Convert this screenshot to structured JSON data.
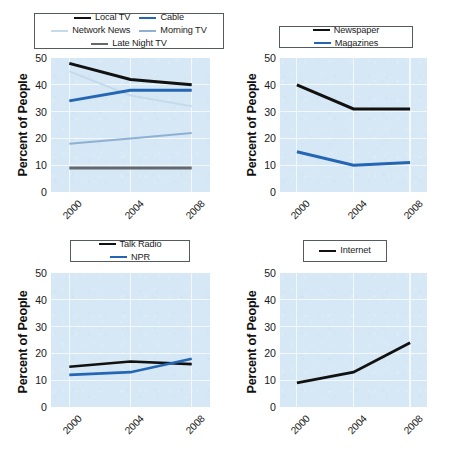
{
  "figure": {
    "background_color": "#ffffff",
    "panel_background_color": "#d6e8f5",
    "gridline_color": "#f2f8fc",
    "ylabel": "Percent of People",
    "yticks": [
      "0",
      "10",
      "20",
      "30",
      "40",
      "50"
    ],
    "xticks": [
      "2000",
      "2004",
      "2008"
    ]
  },
  "chart_data": [
    {
      "type": "line",
      "panel": "top-left",
      "title": "",
      "xlabel": "",
      "ylabel": "Percent of People",
      "x": [
        2000,
        2004,
        2008
      ],
      "xtick_labels": [
        "2000",
        "2004",
        "2008"
      ],
      "ylim": [
        0,
        50
      ],
      "ytick_labels": [
        "0",
        "10",
        "20",
        "30",
        "40",
        "50"
      ],
      "grid": true,
      "legend_position": "above-axes",
      "series": [
        {
          "name": "Local TV",
          "values": [
            48,
            42,
            40
          ],
          "color": "#111111",
          "width": 3.0
        },
        {
          "name": "Cable",
          "values": [
            34,
            38,
            38
          ],
          "color": "#2566b4",
          "width": 3.0
        },
        {
          "name": "Network News",
          "values": [
            45,
            36,
            32
          ],
          "color": "#c5daea",
          "width": 2.0
        },
        {
          "name": "Morning TV",
          "values": [
            18,
            20,
            22
          ],
          "color": "#8fb0d4",
          "width": 2.0
        },
        {
          "name": "Late Night TV",
          "values": [
            9,
            9,
            9
          ],
          "color": "#63696e",
          "width": 3.0
        }
      ]
    },
    {
      "type": "line",
      "panel": "top-right",
      "title": "",
      "xlabel": "",
      "ylabel": "Percent of People",
      "x": [
        2000,
        2004,
        2008
      ],
      "xtick_labels": [
        "2000",
        "2004",
        "2008"
      ],
      "ylim": [
        0,
        50
      ],
      "ytick_labels": [
        "0",
        "10",
        "20",
        "30",
        "40",
        "50"
      ],
      "grid": true,
      "legend_position": "above-axes",
      "series": [
        {
          "name": "Newspaper",
          "values": [
            40,
            31,
            31
          ],
          "color": "#111111",
          "width": 3.0
        },
        {
          "name": "Magazines",
          "values": [
            15,
            10,
            11
          ],
          "color": "#2566b4",
          "width": 3.0
        }
      ]
    },
    {
      "type": "line",
      "panel": "bottom-left",
      "title": "",
      "xlabel": "",
      "ylabel": "Percent of People",
      "x": [
        2000,
        2004,
        2008
      ],
      "xtick_labels": [
        "2000",
        "2004",
        "2008"
      ],
      "ylim": [
        0,
        50
      ],
      "ytick_labels": [
        "0",
        "10",
        "20",
        "30",
        "40",
        "50"
      ],
      "grid": true,
      "legend_position": "above-axes",
      "series": [
        {
          "name": "Talk Radio",
          "values": [
            15,
            17,
            16
          ],
          "color": "#111111",
          "width": 2.6
        },
        {
          "name": "NPR",
          "values": [
            12,
            13,
            18
          ],
          "color": "#2566b4",
          "width": 2.6
        }
      ]
    },
    {
      "type": "line",
      "panel": "bottom-right",
      "title": "",
      "xlabel": "",
      "ylabel": "Percent of People",
      "x": [
        2000,
        2004,
        2008
      ],
      "xtick_labels": [
        "2000",
        "2004",
        "2008"
      ],
      "ylim": [
        0,
        50
      ],
      "ytick_labels": [
        "0",
        "10",
        "20",
        "30",
        "40",
        "50"
      ],
      "grid": true,
      "legend_position": "above-axes",
      "series": [
        {
          "name": "Internet",
          "values": [
            9,
            13,
            24
          ],
          "color": "#111111",
          "width": 2.8
        }
      ]
    }
  ]
}
